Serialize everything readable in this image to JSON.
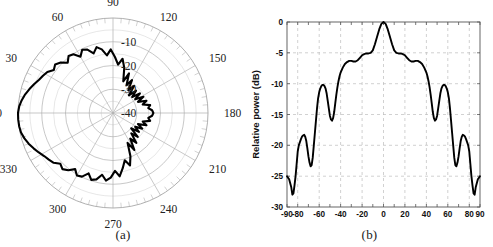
{
  "figure": {
    "panels": [
      {
        "id": "a",
        "caption": "(a)",
        "kind": "polar"
      },
      {
        "id": "b",
        "caption": "(b)",
        "kind": "line"
      }
    ]
  },
  "chart_data": [
    {
      "type": "line",
      "subtype": "polar",
      "panel": "(a)",
      "title": "",
      "xlabel": "",
      "ylabel": "",
      "angle_unit": "degrees",
      "angle_ticks": [
        0,
        30,
        60,
        90,
        120,
        150,
        180,
        210,
        240,
        270,
        300,
        330
      ],
      "angle_tick_labels": [
        "0",
        "30",
        "60",
        "90",
        "120",
        "150",
        "180",
        "210",
        "240",
        "270",
        "300",
        "330"
      ],
      "radial_tick_labels": [
        "-10",
        "-20",
        "-30",
        "-40"
      ],
      "radial_values": [
        -10,
        -20,
        -30,
        -40
      ],
      "rlim": [
        -40,
        0
      ],
      "grid": true,
      "legend": null,
      "series": [
        {
          "name": "radiation pattern",
          "color": "#000000",
          "theta": [
            0,
            4,
            8,
            12,
            16,
            20,
            24,
            28,
            32,
            36,
            40,
            44,
            48,
            52,
            56,
            60,
            64,
            68,
            72,
            76,
            80,
            84,
            88,
            92,
            96,
            100,
            104,
            108,
            112,
            116,
            120,
            124,
            128,
            132,
            136,
            140,
            144,
            148,
            152,
            156,
            160,
            164,
            168,
            172,
            176,
            180,
            184,
            188,
            192,
            196,
            200,
            204,
            208,
            212,
            216,
            220,
            224,
            228,
            232,
            236,
            240,
            244,
            248,
            252,
            256,
            260,
            264,
            268,
            272,
            276,
            280,
            284,
            288,
            292,
            296,
            300,
            304,
            308,
            312,
            316,
            320,
            324,
            328,
            332,
            336,
            340,
            344,
            348,
            352,
            356
          ],
          "r_db": [
            0,
            -0.4,
            -1.2,
            -2.2,
            -3.4,
            -4.6,
            -5.8,
            -6.6,
            -7.4,
            -9.2,
            -8.2,
            -9.4,
            -11.5,
            -9.6,
            -10.2,
            -12.6,
            -10.4,
            -11.2,
            -13.6,
            -11.4,
            -12.8,
            -15.6,
            -13.2,
            -16.4,
            -19.5,
            -16.8,
            -20.4,
            -26.0,
            -22.0,
            -27.0,
            -24.0,
            -28.5,
            -25.5,
            -30.0,
            -26.5,
            -29.5,
            -26.0,
            -29.0,
            -25.5,
            -28.5,
            -25.0,
            -27.0,
            -24.0,
            -25.0,
            -23.5,
            -23.0,
            -23.5,
            -25.0,
            -24.0,
            -27.0,
            -25.0,
            -28.5,
            -26.0,
            -29.0,
            -26.5,
            -30.0,
            -25.5,
            -28.5,
            -24.0,
            -27.0,
            -22.0,
            -26.0,
            -20.4,
            -16.8,
            -19.5,
            -16.4,
            -13.2,
            -15.6,
            -12.8,
            -11.4,
            -13.6,
            -11.2,
            -10.4,
            -12.6,
            -10.2,
            -9.6,
            -11.5,
            -9.4,
            -8.2,
            -9.2,
            -7.4,
            -6.6,
            -5.8,
            -4.6,
            -3.4,
            -2.2,
            -1.2,
            -0.4,
            -0.1,
            0
          ]
        }
      ]
    },
    {
      "type": "line",
      "panel": "(b)",
      "title": "",
      "xlabel": "",
      "ylabel": "Relative power (dB)",
      "xlim": [
        -90,
        90
      ],
      "ylim": [
        -30,
        0
      ],
      "grid": true,
      "grid_style": "dashed",
      "legend": null,
      "xticks": [
        -90,
        -80,
        -60,
        -40,
        -20,
        0,
        20,
        40,
        60,
        80,
        90
      ],
      "xtick_labels": [
        "-90",
        "-80",
        "-60",
        "-40",
        "-20",
        "0",
        "20",
        "40",
        "60",
        "80",
        "90"
      ],
      "yticks": [
        0,
        -5,
        -10,
        -15,
        -20,
        -25,
        -30
      ],
      "ytick_labels": [
        "0",
        "-5",
        "-10",
        "-15",
        "-20",
        "-25",
        "-30"
      ],
      "series": [
        {
          "name": "relative power",
          "color": "#000000",
          "x": [
            -90,
            -88,
            -86,
            -85,
            -84,
            -83,
            -82,
            -81,
            -80,
            -79,
            -78,
            -77,
            -76,
            -75,
            -74,
            -73,
            -72,
            -71,
            -70,
            -69,
            -68,
            -67,
            -66,
            -65,
            -64,
            -63,
            -62,
            -61,
            -60,
            -59,
            -58,
            -57,
            -56,
            -55,
            -54,
            -53,
            -52,
            -51,
            -50,
            -49,
            -48,
            -47,
            -46,
            -45,
            -44,
            -43,
            -42,
            -41,
            -40,
            -38,
            -36,
            -34,
            -32,
            -30,
            -28,
            -26,
            -24,
            -22,
            -20,
            -18,
            -16,
            -14,
            -12,
            -10,
            -8,
            -6,
            -4,
            -2,
            0,
            2,
            4,
            6,
            8,
            10,
            12,
            14,
            16,
            18,
            20,
            22,
            24,
            26,
            28,
            30,
            32,
            34,
            36,
            38,
            40,
            41,
            42,
            43,
            44,
            45,
            46,
            47,
            48,
            49,
            50,
            51,
            52,
            53,
            54,
            55,
            56,
            57,
            58,
            59,
            60,
            61,
            62,
            63,
            64,
            65,
            66,
            67,
            68,
            69,
            70,
            71,
            72,
            73,
            74,
            75,
            76,
            77,
            78,
            79,
            80,
            81,
            82,
            83,
            84,
            85,
            86,
            88,
            90
          ],
          "y": [
            -25.0,
            -25.5,
            -26.8,
            -28.0,
            -27.8,
            -26.5,
            -25.0,
            -23.0,
            -21.0,
            -20.0,
            -19.5,
            -19.0,
            -18.6,
            -18.4,
            -18.3,
            -18.6,
            -19.3,
            -20.5,
            -21.8,
            -22.8,
            -23.4,
            -23.2,
            -22.0,
            -20.0,
            -18.0,
            -16.0,
            -14.0,
            -12.4,
            -11.4,
            -10.8,
            -10.4,
            -10.2,
            -10.2,
            -10.4,
            -10.8,
            -11.6,
            -12.8,
            -14.0,
            -15.2,
            -15.8,
            -16.0,
            -15.6,
            -14.6,
            -13.2,
            -11.8,
            -10.6,
            -9.6,
            -8.8,
            -8.2,
            -7.4,
            -6.8,
            -6.5,
            -6.3,
            -6.3,
            -6.4,
            -6.4,
            -6.2,
            -5.8,
            -5.4,
            -5.2,
            -5.1,
            -5.1,
            -5.0,
            -4.6,
            -3.6,
            -2.4,
            -1.2,
            -0.3,
            0.0,
            -0.3,
            -1.2,
            -2.4,
            -3.6,
            -4.6,
            -5.0,
            -5.1,
            -5.1,
            -5.2,
            -5.4,
            -5.8,
            -6.2,
            -6.4,
            -6.4,
            -6.3,
            -6.3,
            -6.5,
            -6.8,
            -7.4,
            -8.2,
            -8.8,
            -9.6,
            -10.6,
            -11.8,
            -13.2,
            -14.6,
            -15.6,
            -16.0,
            -15.8,
            -15.2,
            -14.0,
            -12.8,
            -11.6,
            -10.8,
            -10.4,
            -10.2,
            -10.2,
            -10.4,
            -10.8,
            -11.4,
            -12.4,
            -14.0,
            -16.0,
            -18.0,
            -20.0,
            -22.0,
            -23.2,
            -23.4,
            -22.8,
            -21.8,
            -20.5,
            -19.3,
            -18.6,
            -18.3,
            -18.4,
            -18.6,
            -19.0,
            -19.5,
            -20.0,
            -21.0,
            -23.0,
            -25.0,
            -26.5,
            -27.8,
            -28.0,
            -26.8,
            -25.5,
            -25.0
          ]
        }
      ]
    }
  ]
}
